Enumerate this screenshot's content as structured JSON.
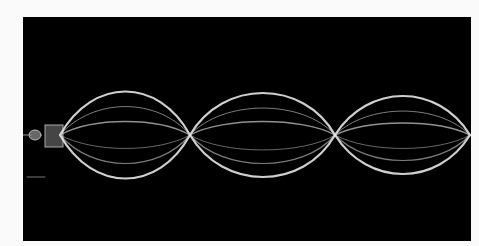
{
  "image": {
    "subject": "Standing wave on a vibrating string",
    "loops": 3,
    "background_color": "#000000",
    "border_color": "#fafafa",
    "wave_color": "#e8e8e8"
  }
}
